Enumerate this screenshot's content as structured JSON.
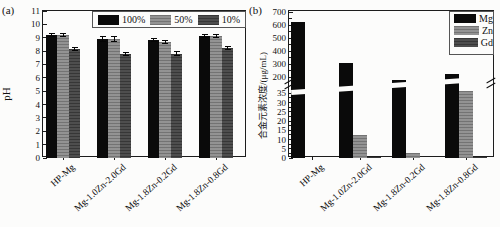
{
  "figure": {
    "background": "#fcfcfb",
    "axis_color": "#1c1c1c"
  },
  "chart_data": [
    {
      "id": "a",
      "type": "bar",
      "panel_label": "(a)",
      "title": "",
      "xlabel": "",
      "ylabel": "pH",
      "ylim": [
        0,
        11
      ],
      "yticks": [
        0,
        1,
        2,
        3,
        4,
        5,
        6,
        7,
        8,
        9,
        10,
        11
      ],
      "grid": false,
      "legend_position": "top-right-horizontal-framed",
      "categories": [
        "HP-Mg",
        "Mg-1.0Zn-2.0Gd",
        "Mg-1.8Zn-0.2Gd",
        "Mg-1.8Zn-0.8Gd"
      ],
      "series": [
        {
          "name": "100%",
          "color": "#0a0a0a",
          "values": [
            9.2,
            8.9,
            8.85,
            9.1
          ],
          "errors": [
            0.1,
            0.2,
            0.1,
            0.12
          ]
        },
        {
          "name": "50%",
          "color": "#8c8c8c",
          "values": [
            9.2,
            8.9,
            8.7,
            9.1
          ],
          "errors": [
            0.1,
            0.2,
            0.12,
            0.12
          ]
        },
        {
          "name": "10%",
          "color": "#434343",
          "values": [
            8.15,
            7.8,
            7.8,
            8.25
          ],
          "errors": [
            0.12,
            0.1,
            0.15,
            0.1
          ]
        }
      ]
    },
    {
      "id": "b",
      "type": "bar",
      "panel_label": "(b)",
      "title": "",
      "xlabel": "",
      "ylabel": "合金元素浓度/(μg/mL)",
      "axis_break": {
        "lower_range": [
          0,
          37.5
        ],
        "upper_range": [
          150,
          707
        ],
        "lower_ticks": [
          0,
          5,
          10,
          15,
          20,
          25,
          30,
          35
        ],
        "upper_ticks": [
          200,
          300,
          400,
          500,
          600,
          700
        ]
      },
      "grid": false,
      "legend_position": "top-right-vertical-framed",
      "categories": [
        "HP-Mg",
        "Mg-1.0Zn-2.0Gd",
        "Mg-1.8Zn-0.2Gd",
        "Mg-1.8Zn-0.8Gd"
      ],
      "series": [
        {
          "name": "Mg",
          "color": "#0a0a0a",
          "values": [
            625,
            310,
            180,
            225
          ]
        },
        {
          "name": "Zn",
          "color": "#8c8c8c",
          "values": [
            0,
            12.5,
            2.5,
            36
          ]
        },
        {
          "name": "Gd",
          "color": "#434343",
          "values": [
            0,
            0.8,
            0.2,
            0.8
          ]
        }
      ]
    }
  ]
}
